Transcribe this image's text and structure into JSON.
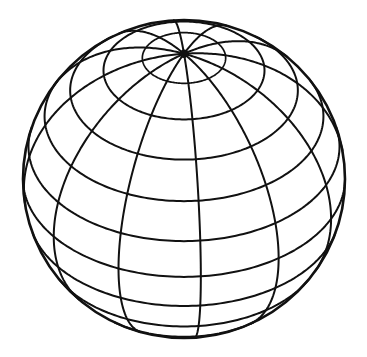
{
  "figure": {
    "background_color": "#ffffff",
    "line_color": "#111111",
    "canvas": {
      "width": 367,
      "height": 357
    }
  },
  "sphere": {
    "center_x": 184,
    "center_y": 179,
    "radius": 161,
    "radius_x": 161,
    "radius_y": 159,
    "view_tilt_degrees": 38,
    "view_rotation_degrees": 6,
    "pole_label": "north-pole",
    "pole_x": 166,
    "pole_y": 68,
    "pole_dot_radius": 4.2
  },
  "graticule": {
    "meridian_count": 12,
    "meridian_spacing_degrees": 30,
    "parallel_spacing_degrees": 15,
    "parallel_latitudes": [
      75,
      60,
      45,
      30,
      15,
      0,
      -15,
      -30,
      -45,
      -60
    ],
    "equator_latitude": 0,
    "stroke_width_outline": 2.6,
    "stroke_width_grid": 2.0,
    "stroke_width_polar": 1.7,
    "sample_steps": 240
  }
}
